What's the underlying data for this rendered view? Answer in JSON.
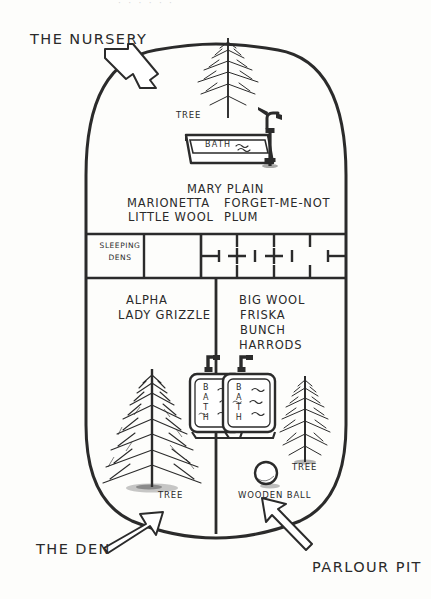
{
  "diagram": {
    "type": "hand-drawn enclosure floor plan",
    "ink_color": "#2b2b2b",
    "paper_color": "#fdfdfb",
    "top_cropped_text": "· · · · · ·"
  },
  "callouts": [
    {
      "id": "nursery",
      "label": "THE NURSERY",
      "arrow": "arrow-down-right"
    },
    {
      "id": "den",
      "label": "THE DEN",
      "arrow": "arrow-up-right"
    },
    {
      "id": "parlour_pit",
      "label": "PARLOUR PIT",
      "arrow": "arrow-up-left"
    }
  ],
  "areas": {
    "nursery": {
      "name": "THE NURSERY",
      "residents_left": [
        "MARIONETTA",
        "LITTLE WOOL"
      ],
      "residents_right": [
        "FORGET-ME-NOT",
        "PLUM"
      ],
      "resident_top": "MARY PLAIN",
      "features": [
        {
          "label": "TREE",
          "icon": "conifer-tree-icon"
        },
        {
          "label": "BATH",
          "icon": "bath-tub-icon"
        },
        {
          "label": "",
          "icon": "water-pump-icon"
        }
      ]
    },
    "sleeping_band": {
      "left_cell_label_line1": "SLEEPING",
      "left_cell_label_line2": "DENS",
      "middle_cell_label": "",
      "grid_cells": 4
    },
    "den": {
      "name": "THE DEN",
      "residents": [
        "ALPHA",
        "LADY GRIZZLE"
      ],
      "features": [
        {
          "label": "TREE",
          "icon": "conifer-tree-icon"
        },
        {
          "label": "BATH",
          "icon": "bath-tub-icon"
        }
      ]
    },
    "parlour_pit": {
      "name": "PARLOUR PIT",
      "residents": [
        "BIG WOOL",
        "FRISKA",
        "BUNCH",
        "HARRODS"
      ],
      "features": [
        {
          "label": "TREE",
          "icon": "conifer-tree-icon"
        },
        {
          "label": "BATH",
          "icon": "bath-tub-icon"
        },
        {
          "label": "WOODEN BALL",
          "icon": "ball-icon"
        }
      ]
    }
  },
  "labels": {
    "tree": "TREE",
    "bath": "BATH",
    "wooden_ball": "WOODEN BALL",
    "sleeping": "SLEEPING",
    "dens": "DENS",
    "mary_plain": "MARY PLAIN",
    "marionetta": "MARIONETTA",
    "little_wool": "LITTLE WOOL",
    "forget_me_not": "FORGET-ME-NOT",
    "plum": "PLUM",
    "alpha": "ALPHA",
    "lady_grizzle": "LADY GRIZZLE",
    "big_wool": "BIG WOOL",
    "friska": "FRISKA",
    "bunch": "BUNCH",
    "harrods": "HARRODS",
    "the_nursery": "THE NURSERY",
    "the_den": "THE DEN",
    "parlour_pit": "PARLOUR PIT",
    "bath_vertical": "BATH"
  }
}
